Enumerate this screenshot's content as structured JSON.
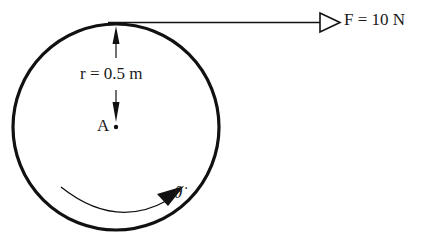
{
  "diagram": {
    "type": "mechanics-free-body",
    "force": {
      "symbol": "F",
      "label": "F = 10 N",
      "value": 10,
      "unit": "N",
      "direction": "right",
      "arrow_style": "open-triangle"
    },
    "radius": {
      "symbol": "r",
      "label": "r = 0.5 m",
      "value": 0.5,
      "unit": "m"
    },
    "pivot": {
      "label": "A"
    },
    "rotation": {
      "symbol": "θ̇",
      "label": "θ̇",
      "direction": "clockwise"
    },
    "colors": {
      "stroke": "#111111",
      "background": "#ffffff"
    }
  }
}
